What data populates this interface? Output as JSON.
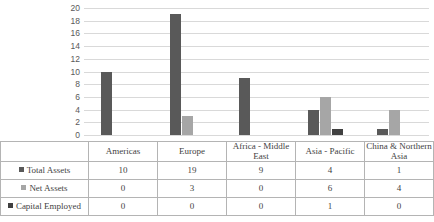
{
  "chart_data": {
    "type": "bar",
    "title": "",
    "xlabel": "",
    "ylabel": "",
    "ylim": [
      0,
      20
    ],
    "ytick_step": 2,
    "yticks": [
      20,
      18,
      16,
      14,
      12,
      10,
      8,
      6,
      4,
      2,
      0
    ],
    "grid": true,
    "legend_position": "table-left",
    "categories": [
      "Americas",
      "Europe",
      "Africa - Middle East",
      "Asia - Pacific",
      "China & Northern Asia"
    ],
    "series": [
      {
        "name": "Total Assets",
        "values": [
          10,
          19,
          9,
          4,
          1
        ],
        "color": "#595959"
      },
      {
        "name": "Net Assets",
        "values": [
          0,
          3,
          0,
          6,
          4
        ],
        "color": "#a6a6a6"
      },
      {
        "name": "Capital Employed",
        "values": [
          0,
          0,
          0,
          1,
          0
        ],
        "color": "#404040"
      }
    ]
  },
  "table": {
    "header_blank": "",
    "column_headers": [
      "Americas",
      "Europe",
      "Africa - Middle East",
      "Asia - Pacific",
      "China & Northern Asia"
    ],
    "rows": [
      {
        "label": "Total Assets",
        "values": [
          "10",
          "19",
          "9",
          "4",
          "1"
        ]
      },
      {
        "label": "Net Assets",
        "values": [
          "0",
          "3",
          "0",
          "6",
          "4"
        ]
      },
      {
        "label": "Capital Employed",
        "values": [
          "0",
          "0",
          "0",
          "1",
          "0"
        ]
      }
    ]
  },
  "colors": {
    "series1": "#595959",
    "series2": "#a6a6a6",
    "series3": "#404040",
    "gridline": "#d9d9d9",
    "border": "#b4b4b4",
    "text": "#3f3f3f"
  }
}
